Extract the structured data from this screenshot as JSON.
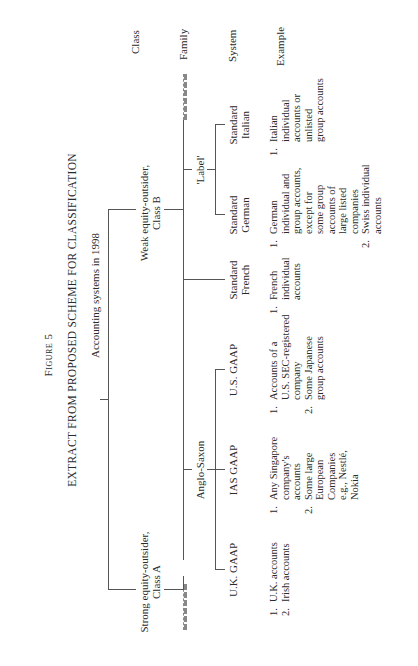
{
  "figure": {
    "number_label": "Figure 5",
    "title": "EXTRACT FROM PROPOSED SCHEME FOR CLASSIFICATION"
  },
  "row_headers": {
    "class": "Class",
    "family": "Family",
    "system": "System",
    "example": "Example"
  },
  "tree": {
    "root": "Accounting systems in 1998",
    "classes": [
      {
        "line1": "Strong equity-outsider,",
        "line2": "Class A"
      },
      {
        "line1": "Weak equity-outsider,",
        "line2": "Class B"
      }
    ],
    "families": [
      {
        "label": "Anglo-Saxon"
      },
      {
        "label": "'Label'"
      }
    ],
    "systems": [
      {
        "line1": "U.K. GAAP",
        "line2": ""
      },
      {
        "line1": "IAS GAAP",
        "line2": ""
      },
      {
        "line1": "U.S. GAAP",
        "line2": ""
      },
      {
        "line1": "Standard",
        "line2": "French"
      },
      {
        "line1": "Standard",
        "line2": "German"
      },
      {
        "line1": "Standard",
        "line2": "Italian"
      }
    ]
  },
  "examples": [
    {
      "items": [
        {
          "num": "1.",
          "lines": [
            "U.K. accounts"
          ]
        },
        {
          "num": "2.",
          "lines": [
            "Irish accounts"
          ]
        }
      ]
    },
    {
      "items": [
        {
          "num": "1.",
          "lines": [
            "Any Singapore",
            "company's",
            "accounts"
          ]
        },
        {
          "num": "2.",
          "lines": [
            "Some large",
            "European",
            "Companies",
            "e.g., Nestlé,",
            "Nokia"
          ]
        }
      ]
    },
    {
      "items": [
        {
          "num": "1.",
          "lines": [
            "Accounts of a",
            "U.S. SEC-registered",
            "company"
          ]
        },
        {
          "num": "2.",
          "lines": [
            "Some Japanese",
            "group accounts"
          ]
        }
      ]
    },
    {
      "items": [
        {
          "num": "1.",
          "lines": [
            "French",
            "individual",
            "accounts"
          ]
        }
      ]
    },
    {
      "items": [
        {
          "num": "1.",
          "lines": [
            "German",
            "individual and",
            "group accounts,",
            "except for",
            "some group",
            "accounts of",
            "large listed",
            "companies"
          ]
        },
        {
          "num": "2.",
          "lines": [
            "Swiss individual",
            "accounts"
          ]
        }
      ]
    },
    {
      "items": [
        {
          "num": "1.",
          "lines": [
            "Italian",
            "individual",
            "accounts or",
            "unlisted",
            "group accounts"
          ]
        }
      ]
    }
  ]
}
